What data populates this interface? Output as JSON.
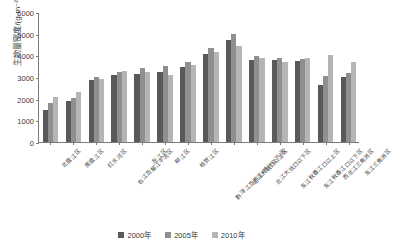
{
  "chart_data": {
    "type": "bar",
    "title": "",
    "xlabel": "",
    "ylabel": "生物量密度/(g·m⁻²)",
    "ylim": [
      0,
      6000
    ],
    "yticks": [
      0,
      1000,
      2000,
      3000,
      4000,
      5000,
      6000
    ],
    "grid": false,
    "legend_position": "bottom",
    "categories": [
      "北盘江区",
      "南盘江区",
      "红水河区",
      "右江及郁江干流区",
      "左江区",
      "柳江区",
      "桂贺江区",
      "黔浔江及西江(梧州以下)区",
      "北江大坑口以上区",
      "北江大坑口以下区",
      "东江秋香江口以上区",
      "东江秋香江口以下区",
      "西北江三角洲区",
      "东江三角洲区"
    ],
    "series": [
      {
        "name": "2000年",
        "color": "#595959",
        "values": [
          1500,
          1900,
          2850,
          3100,
          3150,
          3250,
          3450,
          4050,
          4700,
          3800,
          3800,
          3750,
          2650,
          3000
        ]
      },
      {
        "name": "2005年",
        "color": "#8f8f8f",
        "values": [
          1800,
          2050,
          3000,
          3250,
          3400,
          3500,
          3700,
          4350,
          5000,
          3950,
          3900,
          3850,
          3050,
          3200
        ]
      },
      {
        "name": "2010年",
        "color": "#b5b5b5",
        "values": [
          2100,
          2300,
          2900,
          3300,
          3250,
          3100,
          3550,
          4150,
          4450,
          3900,
          3700,
          3900,
          4000,
          3700
        ]
      }
    ],
    "legend": [
      "2000年",
      "2005年",
      "2010年"
    ]
  }
}
